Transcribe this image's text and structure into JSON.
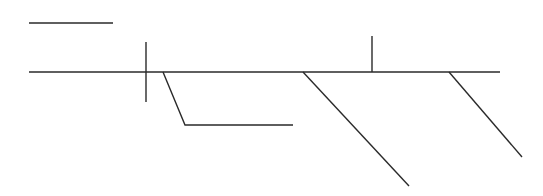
{
  "diagram": {
    "type": "line-diagram",
    "background": "#ffffff",
    "stroke_color": "#2a2a2a",
    "segments": [
      {
        "name": "top-short-line",
        "points": [
          [
            29,
            23
          ],
          [
            113,
            23
          ]
        ]
      },
      {
        "name": "main-horizontal-line",
        "points": [
          [
            29,
            72
          ],
          [
            500,
            72
          ]
        ]
      },
      {
        "name": "left-vertical-tick",
        "points": [
          [
            146,
            42
          ],
          [
            146,
            102
          ]
        ]
      },
      {
        "name": "left-bent-branch",
        "points": [
          [
            163,
            72
          ],
          [
            185,
            125
          ],
          [
            293,
            125
          ]
        ]
      },
      {
        "name": "right-vertical-tick",
        "points": [
          [
            372,
            36
          ],
          [
            372,
            72
          ]
        ]
      },
      {
        "name": "middle-diagonal-branch",
        "points": [
          [
            303,
            72
          ],
          [
            409,
            186
          ]
        ]
      },
      {
        "name": "right-diagonal-branch",
        "points": [
          [
            449,
            72
          ],
          [
            522,
            157
          ]
        ]
      }
    ]
  }
}
